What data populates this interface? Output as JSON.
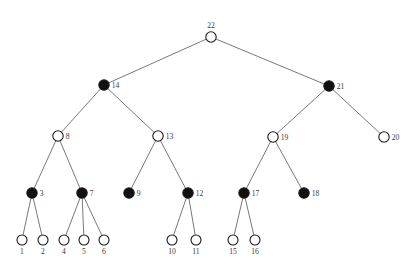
{
  "figure": {
    "type": "binary-merge-tree-diagram",
    "background_color": "#ffffff",
    "edge_color": "#555555",
    "node_stroke_color": "#1a1a1a",
    "node_open_fill": "#ffffff",
    "node_filled_fill": "#111111",
    "label_color": "#3a3a3a",
    "node_radius": 5.2,
    "leaf_radius": 5.0,
    "caption": ""
  },
  "legend": {
    "open_meaning": "unfilled node",
    "filled_meaning": "filled node"
  },
  "chart_data": {
    "type": "tree",
    "title": "",
    "node_count": 22,
    "leaf_count": 11,
    "internal_count": 11,
    "nodes": [
      {
        "id": 1,
        "label": "1",
        "x": 22,
        "y": 240,
        "fill": "open",
        "label_pos": "below",
        "depth": 4
      },
      {
        "id": 2,
        "label": "2",
        "x": 43,
        "y": 240,
        "fill": "open",
        "label_pos": "below",
        "depth": 4
      },
      {
        "id": 3,
        "label": "3",
        "x": 32,
        "y": 193,
        "fill": "filled",
        "label_pos": "right",
        "depth": 3
      },
      {
        "id": 4,
        "label": "4",
        "x": 64,
        "y": 240,
        "fill": "open",
        "label_pos": "below",
        "depth": 4
      },
      {
        "id": 5,
        "label": "5",
        "x": 84,
        "y": 240,
        "fill": "open",
        "label_pos": "below",
        "depth": 4
      },
      {
        "id": 6,
        "label": "6",
        "x": 104,
        "y": 240,
        "fill": "open",
        "label_pos": "below",
        "depth": 4
      },
      {
        "id": 7,
        "label": "7",
        "x": 82,
        "y": 193,
        "fill": "filled",
        "label_pos": "right",
        "depth": 3
      },
      {
        "id": 8,
        "label": "8",
        "x": 58,
        "y": 136,
        "fill": "open",
        "label_pos": "right",
        "depth": 2
      },
      {
        "id": 9,
        "label": "9",
        "x": 129,
        "y": 193,
        "fill": "filled",
        "label_pos": "right",
        "depth": 3
      },
      {
        "id": 10,
        "label": "10",
        "x": 172,
        "y": 240,
        "fill": "open",
        "label_pos": "below",
        "depth": 4
      },
      {
        "id": 11,
        "label": "11",
        "x": 196,
        "y": 240,
        "fill": "open",
        "label_pos": "below",
        "depth": 4
      },
      {
        "id": 12,
        "label": "12",
        "x": 188,
        "y": 193,
        "fill": "filled",
        "label_pos": "right",
        "depth": 3
      },
      {
        "id": 13,
        "label": "13",
        "x": 158,
        "y": 136,
        "fill": "open",
        "label_pos": "right",
        "depth": 2
      },
      {
        "id": 14,
        "label": "14",
        "x": 104,
        "y": 85,
        "fill": "filled",
        "label_pos": "right",
        "depth": 1
      },
      {
        "id": 15,
        "label": "15",
        "x": 233,
        "y": 240,
        "fill": "open",
        "label_pos": "below",
        "depth": 4
      },
      {
        "id": 16,
        "label": "16",
        "x": 255,
        "y": 240,
        "fill": "open",
        "label_pos": "below",
        "depth": 4
      },
      {
        "id": 17,
        "label": "17",
        "x": 244,
        "y": 193,
        "fill": "filled",
        "label_pos": "right",
        "depth": 3
      },
      {
        "id": 18,
        "label": "18",
        "x": 304,
        "y": 193,
        "fill": "filled",
        "label_pos": "right",
        "depth": 3
      },
      {
        "id": 19,
        "label": "19",
        "x": 273,
        "y": 137,
        "fill": "open",
        "label_pos": "right",
        "depth": 2
      },
      {
        "id": 20,
        "label": "20",
        "x": 384,
        "y": 137,
        "fill": "open",
        "label_pos": "right",
        "depth": 2
      },
      {
        "id": 21,
        "label": "21",
        "x": 329,
        "y": 86,
        "fill": "filled",
        "label_pos": "right",
        "depth": 1
      },
      {
        "id": 22,
        "label": "22",
        "x": 211,
        "y": 37,
        "fill": "open",
        "label_pos": "above",
        "depth": 0
      }
    ],
    "edges": [
      {
        "from": 22,
        "to": 14
      },
      {
        "from": 22,
        "to": 21
      },
      {
        "from": 14,
        "to": 8
      },
      {
        "from": 14,
        "to": 13
      },
      {
        "from": 21,
        "to": 19
      },
      {
        "from": 21,
        "to": 20
      },
      {
        "from": 8,
        "to": 3
      },
      {
        "from": 8,
        "to": 7
      },
      {
        "from": 13,
        "to": 9
      },
      {
        "from": 13,
        "to": 12
      },
      {
        "from": 19,
        "to": 17
      },
      {
        "from": 19,
        "to": 18
      },
      {
        "from": 3,
        "to": 1
      },
      {
        "from": 3,
        "to": 2
      },
      {
        "from": 7,
        "to": 4
      },
      {
        "from": 7,
        "to": 5
      },
      {
        "from": 7,
        "to": 6
      },
      {
        "from": 12,
        "to": 10
      },
      {
        "from": 12,
        "to": 11
      },
      {
        "from": 17,
        "to": 15
      },
      {
        "from": 17,
        "to": 16
      }
    ]
  }
}
